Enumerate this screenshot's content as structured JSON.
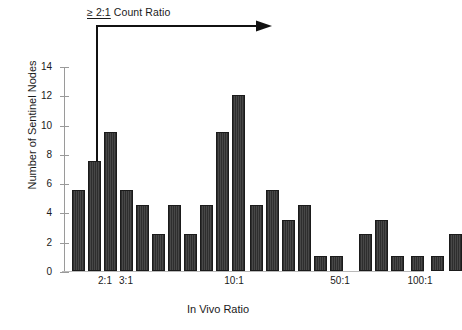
{
  "figure": {
    "annotation": {
      "ge_symbol": "≥ 2:1",
      "rest": " Count Ratio",
      "full_text": "≥ 2:1 Count Ratio",
      "arrow_icon": "right-arrow-icon"
    },
    "colors": {
      "bar_fill": "#3a3a3a",
      "bar_edge": "#1b1b1b",
      "axis": "#9a9a9a",
      "text": "#1a1a1a",
      "background": "#ffffff"
    }
  },
  "chart_data": {
    "type": "bar",
    "title": "",
    "xlabel": "In Vivo Ratio",
    "ylabel": "Number of Sentinel Nodes",
    "ylim": [
      0,
      14
    ],
    "y_ticks": [
      0,
      2,
      4,
      6,
      8,
      10,
      12,
      14
    ],
    "y_tick_labels": [
      "0",
      "2",
      "4",
      "6",
      "8",
      "10",
      "12",
      "14"
    ],
    "x_tick_labels": [
      "2:1",
      "3:1",
      "10:1",
      "50:1",
      "100:1"
    ],
    "x_tick_positions": [
      41,
      62,
      170,
      276,
      356
    ],
    "grid": false,
    "legend": null,
    "bin_count": 26,
    "categories": [
      "b1",
      "b2",
      "b3",
      "b4",
      "b5",
      "b6",
      "b7",
      "b8",
      "b9",
      "b10",
      "b11",
      "b12",
      "b13",
      "b14",
      "b15",
      "b16",
      "b17",
      "b18",
      "b19",
      "b20",
      "b21",
      "b22",
      "b23",
      "b24",
      "b25",
      "b26"
    ],
    "values": [
      5.5,
      7.5,
      9.5,
      5.5,
      4.5,
      2.5,
      4.5,
      2.5,
      4.5,
      9.5,
      12,
      4.5,
      5.5,
      3.5,
      4.5,
      1,
      1,
      0,
      2.5,
      3.5,
      1,
      0,
      1,
      0,
      1,
      2.5
    ],
    "bar_left_px": [
      8,
      24,
      40,
      56,
      72,
      88,
      104,
      120,
      136,
      152,
      168,
      186,
      202,
      218,
      234,
      250,
      266,
      282,
      295,
      311,
      327,
      337,
      347,
      357,
      367,
      385
    ],
    "bar_width_px": 13,
    "annotation_note": "≥ 2:1 Count Ratio arrow spans from the 2:1 bin rightward"
  },
  "caption": {
    "partial_text": ""
  }
}
